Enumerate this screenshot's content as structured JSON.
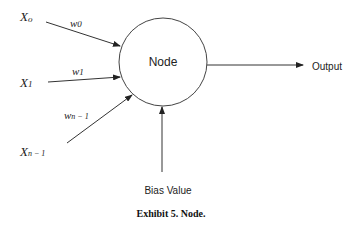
{
  "diagram": {
    "node": {
      "label": "Node"
    },
    "inputs": [
      {
        "var_main": "X",
        "var_sub": "o",
        "weight_main": "w",
        "weight_sub": "0"
      },
      {
        "var_main": "X",
        "var_sub": "1",
        "weight_main": "w",
        "weight_sub": "1"
      },
      {
        "var_main": "X",
        "var_sub": "n − 1",
        "weight_main": "w",
        "weight_sub": "n − 1"
      }
    ],
    "output": {
      "label": "Output"
    },
    "bias": {
      "label": "Bias Value"
    },
    "caption": "Exhibit 5. Node."
  }
}
